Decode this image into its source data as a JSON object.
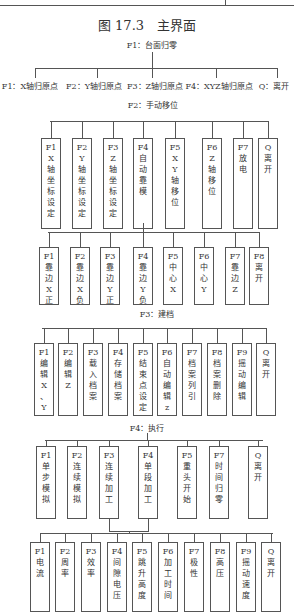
{
  "figure": {
    "caption": "图 17.3　主界面",
    "root": {
      "label": "F1：台面归零",
      "children": [
        "F1：X轴归原点",
        "F2：Y轴归原点",
        "F3：Z轴归原点",
        "F4：XYZ轴归原点",
        "Q：离开"
      ]
    },
    "manual": {
      "label": "F2：手动移位",
      "boxes": [
        [
          "F1",
          "X",
          "轴",
          "坐",
          "标",
          "设",
          "定"
        ],
        [
          "F2",
          "Y",
          "轴",
          "坐",
          "标",
          "设",
          "定"
        ],
        [
          "F3",
          "Z",
          "轴",
          "坐",
          "标",
          "设",
          "定"
        ],
        [
          "F4",
          "自",
          "动",
          "靠",
          "模"
        ],
        [
          "F5",
          "X",
          "Y",
          "轴",
          "移",
          "位"
        ],
        [
          "F6",
          "Z",
          "轴",
          "移",
          "位"
        ],
        [
          "F7",
          "放",
          "电"
        ],
        [
          "Q",
          "离",
          "开"
        ]
      ],
      "sub_boxes": [
        [
          "F1",
          "靠",
          "边",
          "X",
          "正"
        ],
        [
          "F2",
          "靠",
          "边",
          "X",
          "负"
        ],
        [
          "F3",
          "靠",
          "边",
          "Y",
          "正"
        ],
        [
          "F4",
          "靠",
          "边",
          "Y",
          "负"
        ],
        [
          "F5",
          "中",
          "心",
          "X"
        ],
        [
          "F6",
          "中",
          "心",
          "Y"
        ],
        [
          "F7",
          "靠",
          "边",
          "Z"
        ],
        [
          "F8",
          "离",
          "开"
        ]
      ]
    },
    "archive": {
      "label": "F3：建档",
      "boxes": [
        [
          "F1",
          "编",
          "辑",
          "X",
          "、",
          "Y"
        ],
        [
          "F2",
          "编",
          "辑",
          "Z"
        ],
        [
          "F3",
          "载",
          "入",
          "档",
          "案"
        ],
        [
          "F4",
          "存",
          "储",
          "档",
          "案"
        ],
        [
          "F5",
          "结",
          "束",
          "点",
          "设",
          "定"
        ],
        [
          "F6",
          "自",
          "动",
          "编",
          "辑",
          "z"
        ],
        [
          "F7",
          "档",
          "案",
          "列",
          "引"
        ],
        [
          "F8",
          "档",
          "案",
          "删",
          "除"
        ],
        [
          "F9",
          "摇",
          "动",
          "编",
          "辑"
        ],
        [
          "Q",
          "离",
          "开"
        ]
      ]
    },
    "execute": {
      "label": "F4：执行",
      "boxes": [
        [
          "F1",
          "单",
          "步",
          "模",
          "拟"
        ],
        [
          "F2",
          "连",
          "续",
          "模",
          "拟"
        ],
        [
          "F3",
          "连",
          "续",
          "加",
          "工"
        ],
        [
          "F4",
          "单",
          "段",
          "加",
          "工"
        ],
        [
          "F5",
          "重",
          "头",
          "开",
          "始"
        ],
        [
          "F7",
          "时",
          "间",
          "归",
          "零"
        ],
        [
          "Q",
          "离",
          "开"
        ]
      ],
      "sub_boxes": [
        [
          "F1",
          "电",
          "流"
        ],
        [
          "F2",
          "周",
          "率"
        ],
        [
          "F3",
          "效",
          "率"
        ],
        [
          "F4",
          "间",
          "隙",
          "电",
          "压"
        ],
        [
          "F5",
          "跳",
          "升",
          "高",
          "度"
        ],
        [
          "F6",
          "加",
          "工",
          "时",
          "间"
        ],
        [
          "F7",
          "极",
          "性"
        ],
        [
          "F8",
          "高",
          "压"
        ],
        [
          "F9",
          "摇",
          "动",
          "速",
          "度"
        ],
        [
          "Q",
          "离",
          "开"
        ]
      ]
    }
  }
}
